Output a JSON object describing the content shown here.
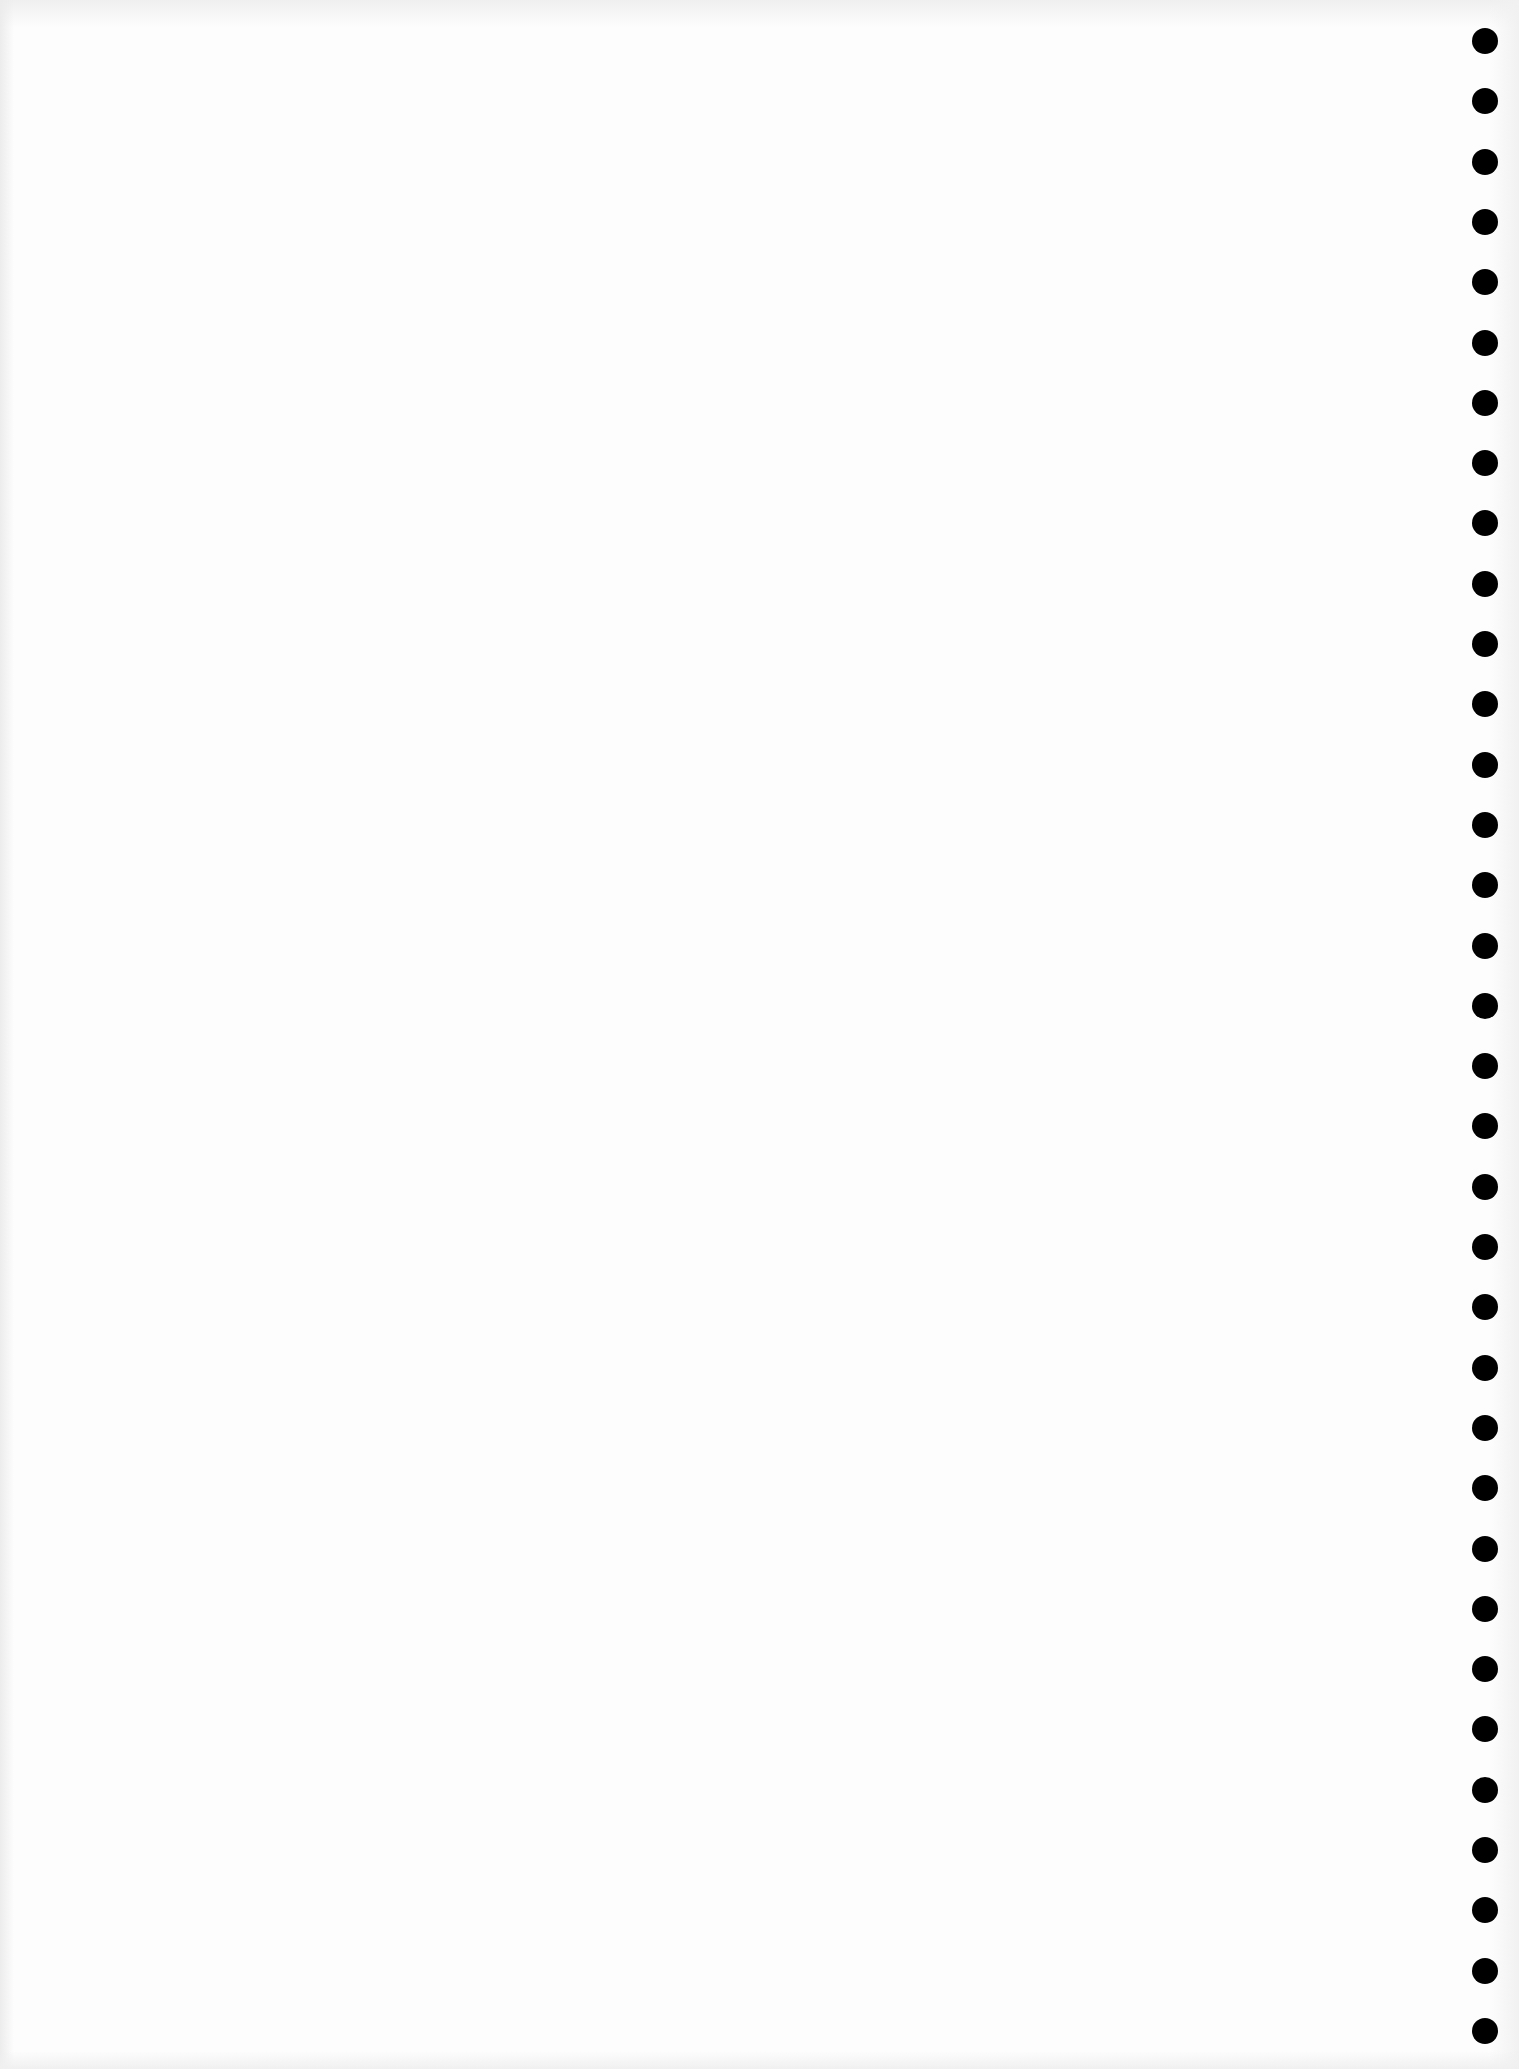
{
  "document": {
    "type": "blank scanned page",
    "text": ""
  },
  "punch_holes": {
    "count": 34,
    "color": "#000000",
    "x_center": 1485,
    "first_y_center": 41,
    "spacing": 60.3,
    "diameter": 26
  },
  "colors": {
    "paper": "#fdfdfd",
    "hole": "#000000"
  }
}
